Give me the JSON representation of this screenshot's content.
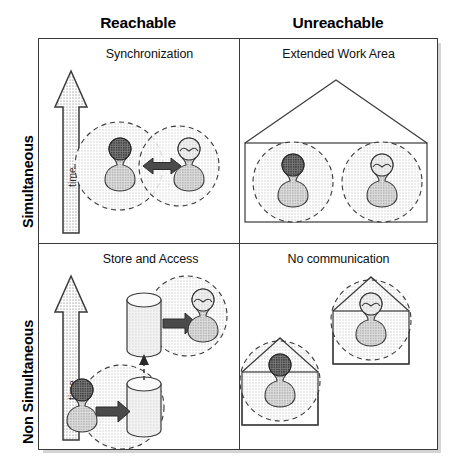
{
  "figure": {
    "type": "diagram",
    "axes": {
      "columns": [
        "Reachable",
        "Unreachable"
      ],
      "rows": [
        "Simultaneous",
        "Non Simultaneous"
      ]
    }
  },
  "headers": {
    "column_left": "Reachable",
    "column_right": "Unreachable",
    "row_top": "Simultaneous",
    "row_bottom": "Non Simultaneous"
  },
  "cells": {
    "top_left": {
      "title": "Synchronization",
      "time_label": "time",
      "icons": [
        "time-arrow-icon",
        "person-dark-icon",
        "person-light-icon",
        "double-arrow-icon",
        "dashed-circle",
        "dashed-circle"
      ]
    },
    "top_right": {
      "title": "Extended Work Area",
      "icons": [
        "house-icon",
        "person-dark-icon",
        "person-light-icon",
        "dashed-circle",
        "dashed-circle"
      ]
    },
    "bottom_left": {
      "title": "Store and Access",
      "time_label": "time",
      "icons": [
        "time-arrow-icon",
        "person-dark-icon",
        "person-light-icon",
        "database-cylinder-icon",
        "database-cylinder-icon",
        "right-arrow-icon",
        "right-arrow-icon",
        "dashed-up-arrow-icon",
        "dashed-circle",
        "dashed-circle"
      ]
    },
    "bottom_right": {
      "title": "No communication",
      "icons": [
        "house-icon",
        "house-icon",
        "person-dark-icon",
        "person-light-icon",
        "dashed-circle",
        "dashed-circle"
      ]
    }
  },
  "colors": {
    "frame": "#3a3a3a",
    "text": "#111111",
    "halftone_fill": "#e9e9e9",
    "arrow_fill": "#4a4a4a",
    "figure_dark": "#4d4d4d",
    "figure_light": "#d8d8d8"
  }
}
